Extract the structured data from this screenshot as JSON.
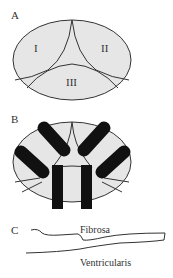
{
  "panels": {
    "a": {
      "label": "A",
      "regions": [
        "I",
        "II",
        "III"
      ]
    },
    "b": {
      "label": "B"
    },
    "c": {
      "label": "C",
      "layer_top": "Fibrosa",
      "layer_bottom": "Ventricularis"
    }
  },
  "colors": {
    "fill": "#e6e6e6",
    "stroke": "#333333",
    "bar": "#111111"
  }
}
